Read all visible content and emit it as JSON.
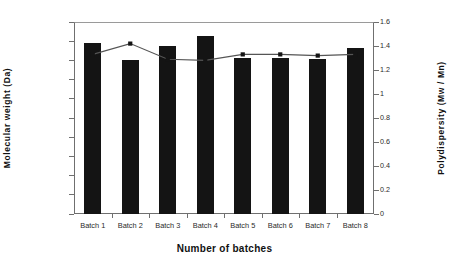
{
  "chart_data": {
    "type": "bar",
    "title": "",
    "xlabel": "Number of batches",
    "categories": [
      "Batch 1",
      "Batch 2",
      "Batch 3",
      "Batch 4",
      "Batch 5",
      "Batch 6",
      "Batch 7",
      "Batch 8"
    ],
    "series": [
      {
        "name": "Molecular weight (Da)",
        "type": "bar",
        "axis": "left",
        "values": [
          890000,
          800000,
          875000,
          925000,
          815000,
          815000,
          805000,
          865000
        ],
        "color": "#141414"
      },
      {
        "name": "Polydispersity (Mw / Mn)",
        "type": "line",
        "axis": "right",
        "marker": "square",
        "values": [
          1.33,
          1.42,
          1.29,
          1.28,
          1.33,
          1.33,
          1.32,
          1.33
        ],
        "color": "#555555"
      }
    ],
    "ylabel": "Molecular weight (Da)",
    "ylabel_right": "Polydispersity (Mw / Mn)",
    "ylim": [
      0,
      1000000
    ],
    "ylim_right": [
      0,
      1.6
    ],
    "yticks_left": [
      "0",
      "100000",
      "200000",
      "300000",
      "400000",
      "500000",
      "600000",
      "700000",
      "800000",
      "900000",
      "1000000"
    ],
    "yticks_right": [
      "0",
      "0.2",
      "0.4",
      "0.6",
      "0.8",
      "1",
      "1.2",
      "1.4",
      "1.6"
    ],
    "grid": false,
    "legend": "none"
  }
}
